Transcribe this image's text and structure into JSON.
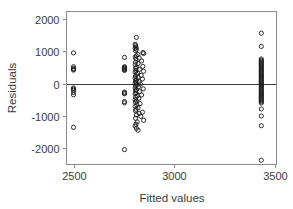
{
  "chart_data": {
    "type": "scatter",
    "title": "",
    "xlabel": "Fitted values",
    "ylabel": "Residuals",
    "xlim": [
      2430,
      3530
    ],
    "ylim": [
      -2450,
      2150
    ],
    "xticks": [
      2500,
      3000,
      3500
    ],
    "xticklabels": [
      "2500",
      "3000",
      "3500"
    ],
    "yticks": [
      2000,
      1000,
      0,
      -1000,
      -2000
    ],
    "yticklabels": [
      "2000",
      "1000",
      "0",
      "-1000",
      "-2000"
    ],
    "grid": false,
    "legend": false,
    "marker": "open-circle",
    "marker_color": "#1a1a1a",
    "reference_line": {
      "orientation": "horizontal",
      "y": 0,
      "color": "#3c3c3c"
    },
    "series": [
      {
        "name": "residuals",
        "points": [
          [
            2500,
            950
          ],
          [
            2500,
            520
          ],
          [
            2500,
            470
          ],
          [
            2500,
            440
          ],
          [
            2500,
            415
          ],
          [
            2500,
            -140
          ],
          [
            2500,
            -175
          ],
          [
            2500,
            -210
          ],
          [
            2500,
            -280
          ],
          [
            2500,
            -350
          ],
          [
            2500,
            -1360
          ],
          [
            2753,
            810
          ],
          [
            2753,
            520
          ],
          [
            2753,
            495
          ],
          [
            2753,
            470
          ],
          [
            2753,
            450
          ],
          [
            2753,
            430
          ],
          [
            2753,
            405
          ],
          [
            2753,
            -265
          ],
          [
            2753,
            -295
          ],
          [
            2753,
            -320
          ],
          [
            2753,
            -560
          ],
          [
            2753,
            -600
          ],
          [
            2753,
            -2050
          ],
          [
            2812,
            1430
          ],
          [
            2806,
            1215
          ],
          [
            2808,
            1175
          ],
          [
            2810,
            1130
          ],
          [
            2806,
            1090
          ],
          [
            2812,
            1060
          ],
          [
            2808,
            1020
          ],
          [
            2845,
            960
          ],
          [
            2848,
            930
          ],
          [
            2820,
            900
          ],
          [
            2812,
            860
          ],
          [
            2806,
            820
          ],
          [
            2826,
            790
          ],
          [
            2810,
            760
          ],
          [
            2838,
            700
          ],
          [
            2808,
            660
          ],
          [
            2820,
            620
          ],
          [
            2806,
            580
          ],
          [
            2844,
            530
          ],
          [
            2812,
            500
          ],
          [
            2808,
            470
          ],
          [
            2826,
            440
          ],
          [
            2810,
            410
          ],
          [
            2848,
            380
          ],
          [
            2806,
            350
          ],
          [
            2818,
            320
          ],
          [
            2812,
            290
          ],
          [
            2836,
            255
          ],
          [
            2808,
            225
          ],
          [
            2820,
            195
          ],
          [
            2806,
            165
          ],
          [
            2842,
            140
          ],
          [
            2812,
            110
          ],
          [
            2808,
            80
          ],
          [
            2826,
            55
          ],
          [
            2810,
            30
          ],
          [
            2806,
            5
          ],
          [
            2832,
            -15
          ],
          [
            2814,
            -45
          ],
          [
            2808,
            -75
          ],
          [
            2822,
            -105
          ],
          [
            2806,
            -135
          ],
          [
            2846,
            -165
          ],
          [
            2812,
            -195
          ],
          [
            2808,
            -225
          ],
          [
            2828,
            -255
          ],
          [
            2810,
            -290
          ],
          [
            2806,
            -320
          ],
          [
            2838,
            -355
          ],
          [
            2816,
            -390
          ],
          [
            2808,
            -425
          ],
          [
            2824,
            -460
          ],
          [
            2806,
            -500
          ],
          [
            2812,
            -540
          ],
          [
            2808,
            -585
          ],
          [
            2830,
            -625
          ],
          [
            2814,
            -665
          ],
          [
            2806,
            -710
          ],
          [
            2820,
            -755
          ],
          [
            2810,
            -800
          ],
          [
            2808,
            -850
          ],
          [
            2842,
            -890
          ],
          [
            2826,
            -930
          ],
          [
            2812,
            -975
          ],
          [
            2834,
            -1020
          ],
          [
            2808,
            -1080
          ],
          [
            2848,
            -1140
          ],
          [
            2816,
            -1190
          ],
          [
            2810,
            -1260
          ],
          [
            2806,
            -1320
          ],
          [
            2812,
            -1390
          ],
          [
            2820,
            -1450
          ],
          [
            3432,
            1560
          ],
          [
            3432,
            1150
          ],
          [
            3432,
            760
          ],
          [
            3432,
            720
          ],
          [
            3432,
            690
          ],
          [
            3432,
            655
          ],
          [
            3432,
            620
          ],
          [
            3432,
            585
          ],
          [
            3432,
            550
          ],
          [
            3432,
            515
          ],
          [
            3432,
            480
          ],
          [
            3432,
            445
          ],
          [
            3432,
            410
          ],
          [
            3432,
            375
          ],
          [
            3432,
            340
          ],
          [
            3432,
            305
          ],
          [
            3432,
            270
          ],
          [
            3432,
            235
          ],
          [
            3432,
            200
          ],
          [
            3432,
            165
          ],
          [
            3432,
            130
          ],
          [
            3432,
            95
          ],
          [
            3432,
            60
          ],
          [
            3432,
            25
          ],
          [
            3432,
            -10
          ],
          [
            3432,
            -45
          ],
          [
            3432,
            -80
          ],
          [
            3432,
            -115
          ],
          [
            3432,
            -150
          ],
          [
            3432,
            -185
          ],
          [
            3432,
            -220
          ],
          [
            3432,
            -255
          ],
          [
            3432,
            -290
          ],
          [
            3432,
            -325
          ],
          [
            3432,
            -360
          ],
          [
            3432,
            -395
          ],
          [
            3432,
            -430
          ],
          [
            3432,
            -465
          ],
          [
            3432,
            -500
          ],
          [
            3432,
            -535
          ],
          [
            3432,
            -570
          ],
          [
            3432,
            -605
          ],
          [
            3432,
            -790
          ],
          [
            3432,
            -1010
          ],
          [
            3432,
            -1310
          ],
          [
            3432,
            -2380
          ]
        ]
      }
    ]
  }
}
